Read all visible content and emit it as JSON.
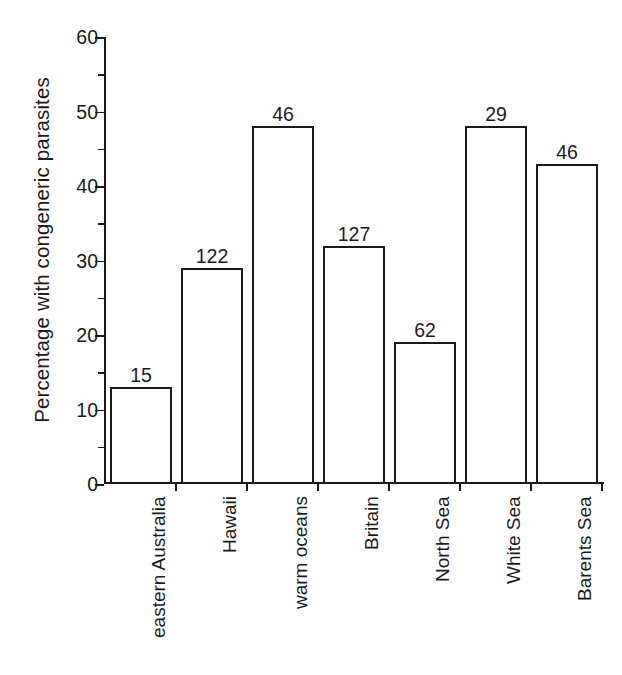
{
  "chart_data": {
    "type": "bar",
    "title": "",
    "xlabel": "",
    "ylabel": "Percentage with congeneric parasites",
    "ylim": [
      0,
      60
    ],
    "ytick_major_step": 10,
    "ytick_minor_step": 5,
    "grid": false,
    "legend": null,
    "categories": [
      "eastern Australia",
      "Hawaii",
      "warm oceans",
      "Britain",
      "North Sea",
      "White Sea",
      "Barents Sea"
    ],
    "values": [
      13,
      29,
      48,
      32,
      19,
      48,
      43
    ],
    "bar_labels": [
      "15",
      "122",
      "46",
      "127",
      "62",
      "29",
      "46"
    ],
    "ytick_labels": [
      "0",
      "10",
      "20",
      "30",
      "40",
      "50",
      "60"
    ],
    "ytick_values": [
      0,
      10,
      20,
      30,
      40,
      50,
      60
    ],
    "minor_tick_values": [
      5,
      15,
      25,
      35,
      45,
      55
    ],
    "bar_fill_color": "#ffffff",
    "bar_edge_color": "#1a1a1a",
    "axis_color": "#1a1a1a",
    "background_color": "#ffffff"
  }
}
